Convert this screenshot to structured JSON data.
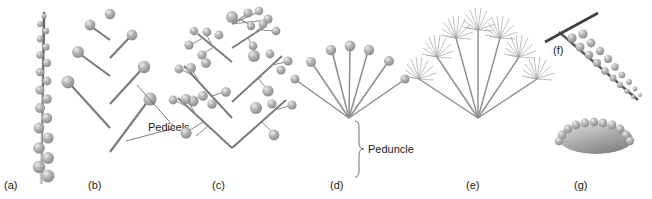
{
  "figure": {
    "background_color": "#ffffff",
    "flower_color": "#a6a6a6",
    "flower_highlight_color": "#e8e8e8",
    "flower_shadow_color": "#6e6e6e",
    "stem_color": "#6b6b6b",
    "stem_light_color": "#b8b8b8",
    "pedicel_color": "#7a7a7a",
    "label_color": "#1a1a1a",
    "leader_color": "#4d4d4d"
  },
  "annotations": [
    {
      "id": "pedicels",
      "label": "Pedicels",
      "x": 148,
      "y": 131,
      "panel": "b"
    },
    {
      "id": "peduncle",
      "label": "Peduncle",
      "x": 357,
      "y": 147,
      "panel": "d"
    }
  ],
  "panels": [
    {
      "id": "a",
      "label": "(a)",
      "name": "spike",
      "label_x": 4,
      "label_y": 189,
      "axis": {
        "x1": 44,
        "y1": 14,
        "x2": 41,
        "y2": 182
      },
      "flower_count": 19,
      "flowers": [
        {
          "x": 44,
          "y": 16,
          "r": 2.6
        },
        {
          "x": 40,
          "y": 24,
          "r": 3.0
        },
        {
          "x": 46,
          "y": 31,
          "r": 3.2
        },
        {
          "x": 40,
          "y": 39,
          "r": 3.4
        },
        {
          "x": 46,
          "y": 47,
          "r": 3.6
        },
        {
          "x": 40,
          "y": 55,
          "r": 3.8
        },
        {
          "x": 47,
          "y": 63,
          "r": 4.0
        },
        {
          "x": 40,
          "y": 72,
          "r": 4.2
        },
        {
          "x": 47,
          "y": 81,
          "r": 4.4
        },
        {
          "x": 40,
          "y": 90,
          "r": 4.6
        },
        {
          "x": 47,
          "y": 99,
          "r": 4.8
        },
        {
          "x": 40,
          "y": 108,
          "r": 5.0
        },
        {
          "x": 47,
          "y": 118,
          "r": 5.2
        },
        {
          "x": 39,
          "y": 128,
          "r": 5.4
        },
        {
          "x": 48,
          "y": 138,
          "r": 5.6
        },
        {
          "x": 39,
          "y": 148,
          "r": 5.8
        },
        {
          "x": 48,
          "y": 158,
          "r": 6.0
        },
        {
          "x": 39,
          "y": 167,
          "r": 6.2
        },
        {
          "x": 48,
          "y": 176,
          "r": 6.4
        }
      ]
    },
    {
      "id": "b",
      "label": "(b)",
      "name": "raceme",
      "label_x": 88,
      "label_y": 189,
      "axis": {
        "x1": 110,
        "y1": 16,
        "x2": 110,
        "y2": 186
      },
      "terminal_flower": {
        "x": 110,
        "y": 14,
        "r": 5.2
      },
      "branches": [
        {
          "x1": 110,
          "y1": 40,
          "x2": 92,
          "y2": 27,
          "fx": 90,
          "fy": 25,
          "fr": 5.4
        },
        {
          "x1": 110,
          "y1": 58,
          "x2": 130,
          "y2": 37,
          "fx": 132,
          "fy": 35,
          "fr": 5.4
        },
        {
          "x1": 110,
          "y1": 76,
          "x2": 80,
          "y2": 54,
          "fx": 78,
          "fy": 52,
          "fr": 6.0
        },
        {
          "x1": 110,
          "y1": 104,
          "x2": 142,
          "y2": 69,
          "fx": 144,
          "fy": 67,
          "fr": 6.2
        },
        {
          "x1": 110,
          "y1": 128,
          "x2": 70,
          "y2": 84,
          "fx": 68,
          "fy": 82,
          "fr": 6.4
        },
        {
          "x1": 110,
          "y1": 152,
          "x2": 148,
          "y2": 101,
          "fx": 150,
          "fy": 99,
          "fr": 6.6
        }
      ],
      "leaders": [
        {
          "x1": 176,
          "y1": 128,
          "x2": 136,
          "y2": 84
        },
        {
          "x1": 176,
          "y1": 128,
          "x2": 127,
          "y2": 140
        }
      ]
    },
    {
      "id": "c",
      "label": "(c)",
      "name": "panicle",
      "label_x": 212,
      "label_y": 189,
      "axis": {
        "x1": 232,
        "y1": 16,
        "x2": 232,
        "y2": 186
      },
      "terminal_cluster": {
        "x": 232,
        "y": 14
      },
      "branches": [
        {
          "x1": 232,
          "y1": 58,
          "x2": 202,
          "y2": 34,
          "dir": "left"
        },
        {
          "x1": 232,
          "y1": 44,
          "x2": 262,
          "y2": 24,
          "dir": "right"
        },
        {
          "x1": 232,
          "y1": 104,
          "x2": 184,
          "y2": 64,
          "dir": "left"
        },
        {
          "x1": 232,
          "y1": 94,
          "x2": 280,
          "y2": 52,
          "dir": "right"
        },
        {
          "x1": 232,
          "y1": 146,
          "x2": 178,
          "y2": 100,
          "dir": "left"
        },
        {
          "x1": 232,
          "y1": 146,
          "x2": 288,
          "y2": 96,
          "dir": "right"
        }
      ]
    },
    {
      "id": "d",
      "label": "(d)",
      "name": "umbel",
      "label_x": 330,
      "label_y": 189,
      "peduncle": {
        "x1": 349,
        "y1": 118,
        "x2": 349,
        "y2": 188
      },
      "hub": {
        "x": 349,
        "y": 118
      },
      "rays": [
        {
          "x": 295,
          "y": 79,
          "r": 4.6
        },
        {
          "x": 311,
          "y": 62,
          "r": 5.0
        },
        {
          "x": 331,
          "y": 50,
          "r": 5.2
        },
        {
          "x": 350,
          "y": 46,
          "r": 5.4
        },
        {
          "x": 369,
          "y": 50,
          "r": 5.2
        },
        {
          "x": 389,
          "y": 61,
          "r": 5.0
        },
        {
          "x": 405,
          "y": 79,
          "r": 4.6
        }
      ],
      "brace": {
        "x": 355,
        "y_top": 120,
        "y_bottom": 186
      }
    },
    {
      "id": "e",
      "label": "(e)",
      "name": "compound-umbel",
      "label_x": 466,
      "label_y": 189,
      "peduncle": {
        "x1": 478,
        "y1": 118,
        "x2": 478,
        "y2": 188
      },
      "hub": {
        "x": 478,
        "y": 118
      },
      "rays": [
        {
          "x": 418,
          "y": 78,
          "angle": 215
        },
        {
          "x": 436,
          "y": 55,
          "angle": 232
        },
        {
          "x": 455,
          "y": 36,
          "angle": 250
        },
        {
          "x": 478,
          "y": 28,
          "angle": 270
        },
        {
          "x": 501,
          "y": 36,
          "angle": 290
        },
        {
          "x": 520,
          "y": 55,
          "angle": 308
        },
        {
          "x": 538,
          "y": 78,
          "angle": 325
        }
      ],
      "umbellet_ray_count": 11,
      "umbellet_radius": 15
    },
    {
      "id": "f",
      "label": "(f)",
      "name": "spike-with-bract",
      "label_x": 556,
      "label_y": 52,
      "axis": {
        "x1": 559,
        "y1": 32,
        "x2": 636,
        "y2": 98
      },
      "bract": {
        "x1": 546,
        "y1": 41,
        "x2": 597,
        "y2": 14
      },
      "flower_count": 16
    },
    {
      "id": "g",
      "label": "(g)",
      "name": "head-capitulum",
      "label_x": 574,
      "label_y": 189,
      "stalk": {
        "x1": 596,
        "y1": 150,
        "x2": 596,
        "y2": 192
      },
      "head": {
        "cx": 596,
        "cy": 139,
        "rx": 37,
        "ry": 15
      },
      "rim_flower_count": 13
    }
  ]
}
